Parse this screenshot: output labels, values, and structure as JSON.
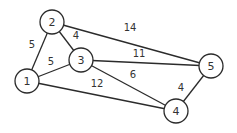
{
  "graph": {
    "nodes": [
      {
        "id": "1",
        "x": 27,
        "y": 81
      },
      {
        "id": "2",
        "x": 52,
        "y": 22
      },
      {
        "id": "3",
        "x": 81,
        "y": 60
      },
      {
        "id": "4",
        "x": 176,
        "y": 111
      },
      {
        "id": "5",
        "x": 211,
        "y": 66
      }
    ],
    "edges": [
      {
        "from": "1",
        "to": "2",
        "weight": "5",
        "lx": 32,
        "ly": 44
      },
      {
        "from": "2",
        "to": "3",
        "weight": "4",
        "lx": 76,
        "ly": 35
      },
      {
        "from": "1",
        "to": "3",
        "weight": "5",
        "lx": 51,
        "ly": 61
      },
      {
        "from": "2",
        "to": "5",
        "weight": "14",
        "lx": 130,
        "ly": 27
      },
      {
        "from": "3",
        "to": "5",
        "weight": "11",
        "lx": 139,
        "ly": 53
      },
      {
        "from": "3",
        "to": "4",
        "weight": "6",
        "lx": 133,
        "ly": 74
      },
      {
        "from": "1",
        "to": "4",
        "weight": "12",
        "lx": 97,
        "ly": 83
      },
      {
        "from": "4",
        "to": "5",
        "weight": "4",
        "lx": 181,
        "ly": 87
      }
    ]
  }
}
